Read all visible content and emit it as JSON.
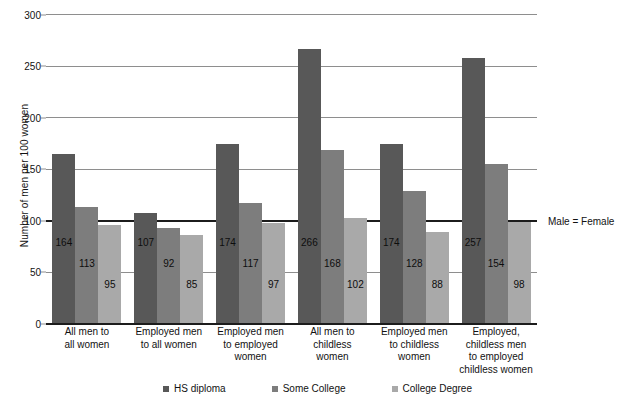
{
  "chart_data": {
    "type": "bar",
    "title": "",
    "xlabel": "",
    "ylabel": "Number of men per 100 women",
    "ylim": [
      0,
      300
    ],
    "yticks": [
      0,
      50,
      100,
      150,
      200,
      250,
      300
    ],
    "ytick_labels": [
      "0",
      "50",
      "100",
      "150",
      "200",
      "250",
      "300"
    ],
    "grid": true,
    "legend_position": "bottom",
    "categories": [
      "All men to all women",
      "Employed men to all women",
      "Employed men to employed women",
      "All men to childless women",
      "Employed men to childless women",
      "Employed, childless men to employed childless women"
    ],
    "category_lines": [
      [
        "All men to",
        "all women"
      ],
      [
        "Employed men",
        "to all women"
      ],
      [
        "Employed men",
        "to employed",
        "women"
      ],
      [
        "All men to",
        "childless",
        "women"
      ],
      [
        "Employed men",
        "to childless",
        "women"
      ],
      [
        "Employed,",
        "childless men",
        "to employed",
        "childless women"
      ]
    ],
    "series": [
      {
        "name": "HS diploma",
        "color": "#585858",
        "values": [
          164,
          107,
          174,
          266,
          174,
          257
        ]
      },
      {
        "name": "Some College",
        "color": "#7d7d7d",
        "values": [
          113,
          92,
          117,
          168,
          128,
          154
        ]
      },
      {
        "name": "College Degree",
        "color": "#a9a9a9",
        "values": [
          95,
          85,
          97,
          102,
          88,
          98
        ]
      }
    ],
    "annotations": [
      {
        "name": "parity-line",
        "label": "Male = Female",
        "y_value": 100
      }
    ]
  },
  "legend": {
    "items": [
      {
        "label": "HS diploma",
        "color": "#585858"
      },
      {
        "label": "Some College",
        "color": "#7d7d7d"
      },
      {
        "label": "College Degree",
        "color": "#a9a9a9"
      }
    ]
  }
}
